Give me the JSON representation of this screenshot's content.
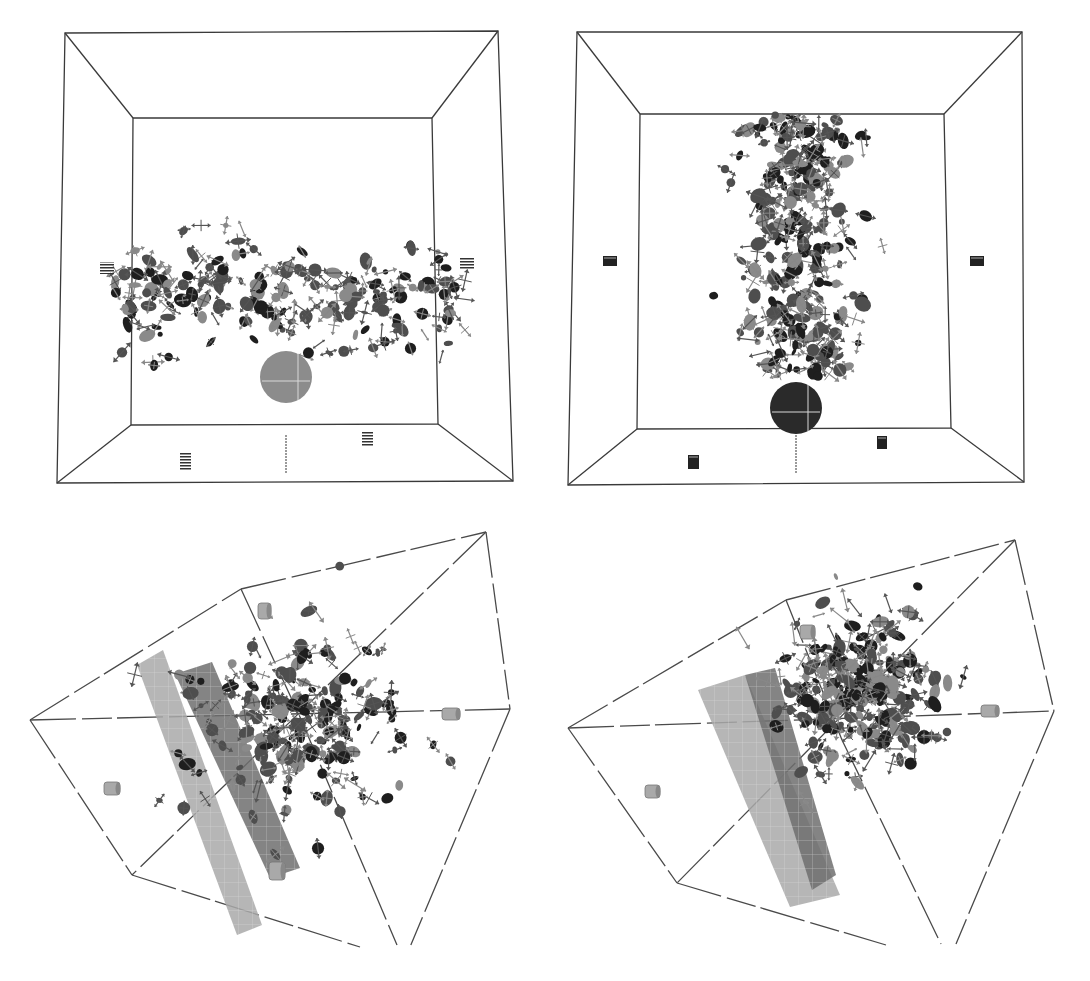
{
  "figure": {
    "panel_count": 4,
    "background": "#ffffff",
    "colors": {
      "edge": "#3a3a3a",
      "glyph_dark": "#1e1e1e",
      "glyph_mid": "#4e4e4e",
      "glyph_light": "#8a8a8a",
      "disc_light": "#8c8c8c",
      "disc_dark": "#2a2a2a",
      "cylinder_light": "#a9a9a9",
      "cylinder_dark": "#6e6e6e"
    },
    "caption_fragment": "",
    "panels": [
      {
        "id": "top-left",
        "view": "front",
        "box": {
          "outer": [
            [
              65,
              33
            ],
            [
              498,
              31
            ],
            [
              513,
              481
            ],
            [
              57,
              483
            ]
          ],
          "inner": [
            [
              133,
              118
            ],
            [
              432,
              118
            ],
            [
              438,
              424
            ],
            [
              131,
              425
            ]
          ]
        },
        "markers": [
          {
            "type": "stripe",
            "x": 100,
            "y": 262,
            "w": 14,
            "h": 12
          },
          {
            "type": "stripe",
            "x": 460,
            "y": 258,
            "w": 14,
            "h": 12
          },
          {
            "type": "stripe",
            "x": 180,
            "y": 452,
            "w": 11,
            "h": 18
          },
          {
            "type": "stripe",
            "x": 362,
            "y": 432,
            "w": 11,
            "h": 14
          }
        ],
        "disc": {
          "cx": 286,
          "cy": 377,
          "r": 26,
          "shade": "light"
        },
        "post": {
          "x": 286,
          "y1": 435,
          "y2": 473
        },
        "cluster": {
          "cx": 290,
          "cy": 300,
          "sx": 140,
          "sy": 45,
          "count": 230,
          "seed": 11,
          "shape": "band"
        }
      },
      {
        "id": "top-right",
        "view": "front",
        "box": {
          "outer": [
            [
              577,
              32
            ],
            [
              1022,
              32
            ],
            [
              1024,
              482
            ],
            [
              568,
              485
            ]
          ],
          "inner": [
            [
              640,
              114
            ],
            [
              944,
              114
            ],
            [
              951,
              428
            ],
            [
              637,
              429
            ]
          ]
        },
        "markers": [
          {
            "type": "block",
            "x": 603,
            "y": 256,
            "w": 14,
            "h": 10
          },
          {
            "type": "block",
            "x": 970,
            "y": 256,
            "w": 14,
            "h": 10
          },
          {
            "type": "block",
            "x": 688,
            "y": 455,
            "w": 11,
            "h": 14
          },
          {
            "type": "block",
            "x": 877,
            "y": 436,
            "w": 10,
            "h": 13
          }
        ],
        "disc": {
          "cx": 796,
          "cy": 408,
          "r": 26,
          "shade": "dark"
        },
        "post": {
          "x": 796,
          "y1": 435,
          "y2": 473
        },
        "cluster": {
          "cx": 800,
          "cy": 245,
          "sx": 48,
          "sy": 115,
          "count": 330,
          "seed": 27,
          "shape": "column"
        }
      },
      {
        "id": "bottom-left",
        "view": "oblique",
        "box": {
          "edges": [
            [
              [
                30,
                720
              ],
              [
                241,
                589
              ]
            ],
            [
              [
                241,
                589
              ],
              [
                486,
                532
              ]
            ],
            [
              [
                486,
                532
              ],
              [
                510,
                709
              ]
            ],
            [
              [
                30,
                720
              ],
              [
                132,
                875
              ]
            ],
            [
              [
                132,
                875
              ],
              [
                360,
                947
              ]
            ],
            [
              [
                241,
                589
              ],
              [
                300,
                717
              ]
            ],
            [
              [
                30,
                720
              ],
              [
                510,
                709
              ]
            ],
            [
              [
                486,
                532
              ],
              [
                132,
                875
              ]
            ],
            [
              [
                300,
                717
              ],
              [
                397,
                945
              ]
            ],
            [
              [
                510,
                709
              ],
              [
                410,
                947
              ]
            ]
          ]
        },
        "slabs": [
          {
            "points": [
              [
                137,
                665
              ],
              [
                163,
                650
              ],
              [
                262,
                925
              ],
              [
                237,
                935
              ]
            ],
            "shade": "light"
          },
          {
            "points": [
              [
                175,
                674
              ],
              [
                212,
                662
              ],
              [
                300,
                868
              ],
              [
                270,
                878
              ]
            ],
            "shade": "mid"
          }
        ],
        "cylinders": [
          {
            "x": 258,
            "y": 603,
            "w": 13,
            "h": 16
          },
          {
            "x": 442,
            "y": 708,
            "w": 18,
            "h": 12
          },
          {
            "x": 104,
            "y": 782,
            "w": 16,
            "h": 13
          },
          {
            "x": 269,
            "y": 862,
            "w": 16,
            "h": 18
          }
        ],
        "cluster": {
          "cx": 300,
          "cy": 720,
          "sx": 100,
          "sy": 85,
          "count": 260,
          "seed": 53,
          "shape": "blob"
        }
      },
      {
        "id": "bottom-right",
        "view": "oblique",
        "box": {
          "edges": [
            [
              [
                568,
                728
              ],
              [
                786,
                600
              ]
            ],
            [
              [
                786,
                600
              ],
              [
                1015,
                540
              ]
            ],
            [
              [
                1015,
                540
              ],
              [
                1054,
                711
              ]
            ],
            [
              [
                568,
                728
              ],
              [
                677,
                883
              ]
            ],
            [
              [
                677,
                883
              ],
              [
                886,
                945
              ]
            ],
            [
              [
                786,
                600
              ],
              [
                842,
                740
              ]
            ],
            [
              [
                568,
                728
              ],
              [
                1054,
                711
              ]
            ],
            [
              [
                1015,
                540
              ],
              [
                677,
                883
              ]
            ],
            [
              [
                842,
                740
              ],
              [
                941,
                944
              ]
            ],
            [
              [
                1054,
                711
              ],
              [
                956,
                944
              ]
            ]
          ]
        },
        "slabs": [
          {
            "points": [
              [
                698,
                690
              ],
              [
                745,
                675
              ],
              [
                840,
                895
              ],
              [
                790,
                907
              ]
            ],
            "shade": "light"
          },
          {
            "points": [
              [
                745,
                675
              ],
              [
                775,
                668
              ],
              [
                836,
                875
              ],
              [
                812,
                890
              ]
            ],
            "shade": "mid"
          }
        ],
        "cylinders": [
          {
            "x": 800,
            "y": 625,
            "w": 15,
            "h": 14
          },
          {
            "x": 981,
            "y": 705,
            "w": 18,
            "h": 12
          },
          {
            "x": 645,
            "y": 785,
            "w": 15,
            "h": 13
          }
        ],
        "cluster": {
          "cx": 860,
          "cy": 695,
          "sx": 70,
          "sy": 72,
          "count": 340,
          "seed": 89,
          "shape": "blob"
        }
      }
    ]
  }
}
